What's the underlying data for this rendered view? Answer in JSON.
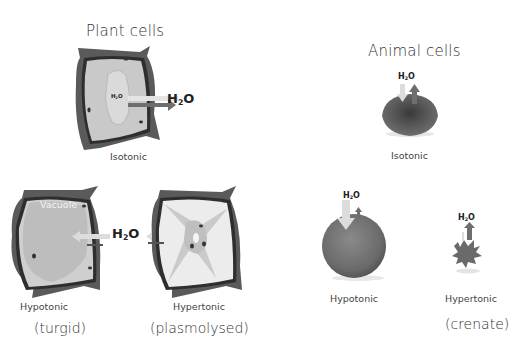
{
  "plant": {
    "title": "Plant cells",
    "isotonic": {
      "label": "Isotonic",
      "h2o_inner": "H",
      "h2o_inner_sub": "2",
      "h2o_inner_o": "O",
      "h2o_outer": "H",
      "h2o_outer_sub": "2",
      "h2o_outer_o": "O"
    },
    "hypotonic": {
      "label": "Hypotonic",
      "state": "(turgid)",
      "vacuole_label": "Vacuole"
    },
    "hypertonic": {
      "label": "Hypertonic",
      "state": "(plasmolysed)"
    },
    "shared_h2o": {
      "h": "H",
      "sub": "2",
      "o": "O"
    }
  },
  "animal": {
    "title": "Animal cells",
    "isotonic": {
      "label": "Isotonic",
      "h2o": {
        "h": "H",
        "sub": "2",
        "o": "O"
      }
    },
    "hypotonic": {
      "label": "Hypotonic",
      "h2o": {
        "h": "H",
        "sub": "2",
        "o": "O"
      }
    },
    "hypertonic": {
      "label": "Hypertonic",
      "state": "(crenate)",
      "h2o": {
        "h": "H",
        "sub": "2",
        "o": "O"
      }
    }
  },
  "colors": {
    "cell_wall": "#5a5a5a",
    "membrane": "#2e2e2e",
    "cytoplasm": "#c9c9c9",
    "vacuole": "#b5b5b5",
    "arrow_light": "#dcdcdc",
    "arrow_dark": "#6e6e6e",
    "rbc": "#585858"
  }
}
